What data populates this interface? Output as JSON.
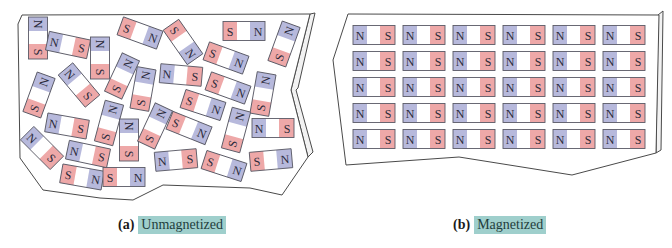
{
  "figure": {
    "colors": {
      "north": "#b7b9dc",
      "south": "#eea8a8",
      "label_highlight": "#9fcfcc",
      "outline": "#4a4a4a"
    },
    "panels": [
      {
        "id": "a",
        "tag": "(a)",
        "label": "Unmagnetized",
        "magnets": [
          {
            "x": 38,
            "y": 38,
            "rot": 90,
            "left": "N",
            "right": "S"
          },
          {
            "x": 68,
            "y": 45,
            "rot": 12,
            "left": "N",
            "right": "S"
          },
          {
            "x": 100,
            "y": 58,
            "rot": 90,
            "left": "N",
            "right": "S"
          },
          {
            "x": 140,
            "y": 33,
            "rot": 20,
            "left": "S",
            "right": "N"
          },
          {
            "x": 183,
            "y": 42,
            "rot": 55,
            "left": "S",
            "right": "N"
          },
          {
            "x": 244,
            "y": 31,
            "rot": 0,
            "left": "S",
            "right": "N"
          },
          {
            "x": 284,
            "y": 44,
            "rot": -70,
            "left": "S",
            "right": "N"
          },
          {
            "x": 226,
            "y": 58,
            "rot": 20,
            "left": "S",
            "right": "N"
          },
          {
            "x": 39,
            "y": 95,
            "rot": -70,
            "left": "S",
            "right": "N"
          },
          {
            "x": 79,
            "y": 85,
            "rot": 50,
            "left": "N",
            "right": "S"
          },
          {
            "x": 122,
            "y": 76,
            "rot": -65,
            "left": "S",
            "right": "N"
          },
          {
            "x": 143,
            "y": 89,
            "rot": -80,
            "left": "S",
            "right": "N"
          },
          {
            "x": 181,
            "y": 75,
            "rot": 5,
            "left": "N",
            "right": "S"
          },
          {
            "x": 228,
            "y": 88,
            "rot": 20,
            "left": "S",
            "right": "N"
          },
          {
            "x": 263,
            "y": 94,
            "rot": -80,
            "left": "S",
            "right": "N"
          },
          {
            "x": 67,
            "y": 126,
            "rot": 10,
            "left": "N",
            "right": "S"
          },
          {
            "x": 109,
            "y": 123,
            "rot": -75,
            "left": "S",
            "right": "N"
          },
          {
            "x": 129,
            "y": 140,
            "rot": 90,
            "left": "N",
            "right": "S"
          },
          {
            "x": 155,
            "y": 126,
            "rot": -65,
            "left": "S",
            "right": "N"
          },
          {
            "x": 203,
            "y": 105,
            "rot": 18,
            "left": "S",
            "right": "N"
          },
          {
            "x": 189,
            "y": 128,
            "rot": 22,
            "left": "S",
            "right": "N"
          },
          {
            "x": 236,
            "y": 130,
            "rot": -75,
            "left": "S",
            "right": "N"
          },
          {
            "x": 273,
            "y": 128,
            "rot": 0,
            "left": "N",
            "right": "S"
          },
          {
            "x": 42,
            "y": 148,
            "rot": 45,
            "left": "N",
            "right": "S"
          },
          {
            "x": 88,
            "y": 154,
            "rot": 12,
            "left": "N",
            "right": "S"
          },
          {
            "x": 82,
            "y": 177,
            "rot": 10,
            "left": "S",
            "right": "N"
          },
          {
            "x": 124,
            "y": 177,
            "rot": 0,
            "left": "S",
            "right": "N"
          },
          {
            "x": 176,
            "y": 160,
            "rot": -5,
            "left": "N",
            "right": "S"
          },
          {
            "x": 224,
            "y": 166,
            "rot": 18,
            "left": "S",
            "right": "N"
          },
          {
            "x": 271,
            "y": 160,
            "rot": -5,
            "left": "S",
            "right": "N"
          }
        ]
      },
      {
        "id": "b",
        "tag": "(b)",
        "label": "Magnetized",
        "grid": {
          "cols": 6,
          "rows": 5,
          "left": "N",
          "right": "S"
        }
      }
    ]
  }
}
